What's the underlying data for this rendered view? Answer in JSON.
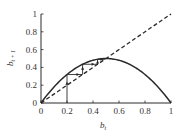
{
  "chart_data": {
    "type": "line",
    "title": "",
    "xlabel": "b_t",
    "ylabel": "b_{t+1}",
    "xlim": [
      0,
      1
    ],
    "ylim": [
      0,
      1
    ],
    "grid": false,
    "legend": null,
    "x_ticks": [
      "0",
      "0.2",
      "0.4",
      "0.6",
      "0.8",
      "1"
    ],
    "y_ticks": [
      "0",
      "0.2",
      "0.4",
      "0.6",
      "0.8",
      "1"
    ],
    "series": [
      {
        "name": "map curve",
        "style": "solid",
        "formula": "b_{t+1} = 2 b_t (1 - b_t)",
        "x": [
          0,
          0.1,
          0.2,
          0.3,
          0.4,
          0.5,
          0.6,
          0.7,
          0.8,
          0.9,
          1.0
        ],
        "y": [
          0,
          0.18,
          0.32,
          0.42,
          0.48,
          0.5,
          0.48,
          0.42,
          0.32,
          0.18,
          0
        ]
      },
      {
        "name": "identity line",
        "style": "dashed",
        "x": [
          0,
          1
        ],
        "y": [
          0,
          1
        ]
      },
      {
        "name": "cobweb iteration",
        "style": "solid-with-arrows",
        "start": 0.2,
        "iterates": [
          0.2,
          0.32,
          0.4352,
          0.4916,
          0.4999
        ]
      }
    ]
  },
  "labels": {
    "xlabel_main": "b",
    "xlabel_sub": "t",
    "ylabel_main": "b",
    "ylabel_sub": "t + 1"
  },
  "colors": {
    "line": "#2a2a2a",
    "text": "#333333",
    "background": "#ffffff"
  }
}
